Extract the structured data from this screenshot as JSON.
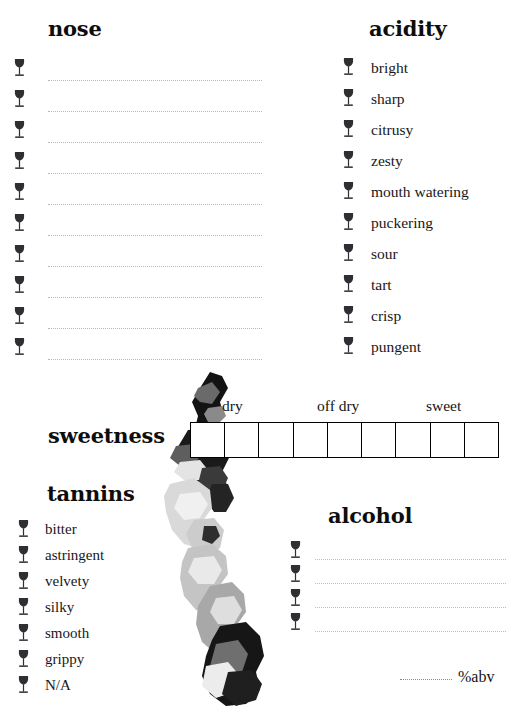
{
  "page": {
    "background_color": "#ffffff",
    "ink_color": "#18181a"
  },
  "nose": {
    "heading": "nose",
    "icon": "wine-glass-icon",
    "line_count": 10,
    "lines": [
      "",
      "",
      "",
      "",
      "",
      "",
      "",
      "",
      "",
      ""
    ]
  },
  "acidity": {
    "heading": "acidity",
    "icon": "wine-glass-icon",
    "items": [
      "bright",
      "sharp",
      "citrusy",
      "zesty",
      "mouth watering",
      "puckering",
      "sour",
      "tart",
      "crisp",
      "pungent"
    ]
  },
  "sweetness": {
    "heading": "sweetness",
    "cell_count": 9,
    "scale_labels": [
      "dry",
      "off dry",
      "sweet"
    ],
    "border_color": "#000000"
  },
  "tannins": {
    "heading": "tannins",
    "icon": "wine-glass-icon",
    "items": [
      "bitter",
      "astringent",
      "velvety",
      "silky",
      "smooth",
      "grippy",
      "N/A"
    ]
  },
  "alcohol": {
    "heading": "alcohol",
    "icon": "wine-glass-icon",
    "line_count": 4,
    "lines": [
      "",
      "",
      "",
      ""
    ],
    "abv_label": "%abv",
    "abv_value": ""
  },
  "decoration": {
    "name": "watercolor-splash",
    "palette": [
      "#0d0d0d",
      "#2b2b2b",
      "#5a5a5a",
      "#9a9a9a",
      "#c9c9c9",
      "#e6e6e6"
    ]
  }
}
